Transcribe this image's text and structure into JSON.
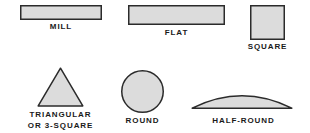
{
  "figure": {
    "background_color": "#ffffff",
    "shape_fill_color": "#dcdcdc",
    "shape_stroke_color": "#2b2b2b",
    "label_color": "#1a1a1a"
  },
  "shapes": [
    {
      "id": "mill",
      "icon": "thin-rectangle-icon",
      "label": "MILL",
      "geometry": {
        "type": "rectangle",
        "width": 82,
        "height": 15
      }
    },
    {
      "id": "flat",
      "icon": "rectangle-icon",
      "label": "FLAT",
      "geometry": {
        "type": "rectangle",
        "width": 97,
        "height": 20
      }
    },
    {
      "id": "square",
      "icon": "square-icon",
      "label": "SQUARE",
      "geometry": {
        "type": "rectangle",
        "width": 35,
        "height": 35
      }
    },
    {
      "id": "triangular",
      "icon": "triangle-icon",
      "label": "TRIANGULAR\nOR 3-SQUARE",
      "geometry": {
        "type": "triangle",
        "width": 47,
        "height": 40
      }
    },
    {
      "id": "round",
      "icon": "circle-icon",
      "label": "ROUND",
      "geometry": {
        "type": "circle",
        "diameter": 43
      }
    },
    {
      "id": "halfround",
      "icon": "half-round-icon",
      "label": "HALF-ROUND",
      "geometry": {
        "type": "circular-segment",
        "width": 101,
        "height": 22
      }
    }
  ]
}
